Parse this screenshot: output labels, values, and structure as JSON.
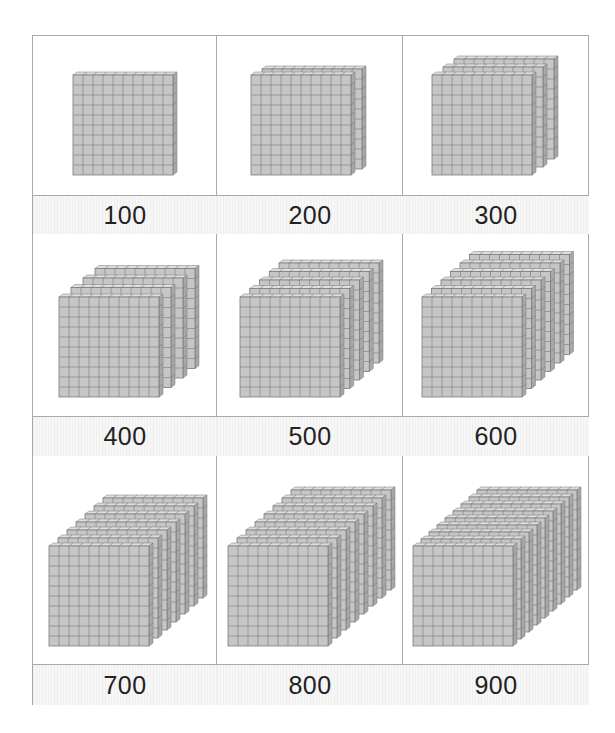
{
  "colors": {
    "border": "#a9a9a9",
    "face": "#c6c6c6",
    "top": "#dedede",
    "side": "#a8a8a8",
    "grid": "#7a7a7a",
    "label_text": "#222222"
  },
  "cards": [
    {
      "label": "100",
      "flats": 1,
      "front_x": 73,
      "front_y": 75,
      "dx": 0,
      "dy": 0
    },
    {
      "label": "200",
      "flats": 2,
      "front_x": 251,
      "front_y": 75,
      "dx": 11,
      "dy": -6
    },
    {
      "label": "300",
      "flats": 3,
      "front_x": 432,
      "front_y": 75,
      "dx": 11,
      "dy": -8
    },
    {
      "label": "400",
      "flats": 4,
      "front_x": 59,
      "front_y": 297,
      "dx": 12,
      "dy": -9.5
    },
    {
      "label": "500",
      "flats": 5,
      "front_x": 240,
      "front_y": 297,
      "dx": 9.75,
      "dy": -8.5
    },
    {
      "label": "600",
      "flats": 6,
      "front_x": 422,
      "front_y": 297,
      "dx": 9.5,
      "dy": -8.5
    },
    {
      "label": "700",
      "flats": 7,
      "front_x": 49,
      "front_y": 546,
      "dx": 9,
      "dy": -8
    },
    {
      "label": "800",
      "flats": 8,
      "front_x": 228,
      "front_y": 546,
      "dx": 9,
      "dy": -8
    },
    {
      "label": "900",
      "flats": 9,
      "front_x": 413,
      "front_y": 546,
      "dx": 8,
      "dy": -7
    }
  ]
}
